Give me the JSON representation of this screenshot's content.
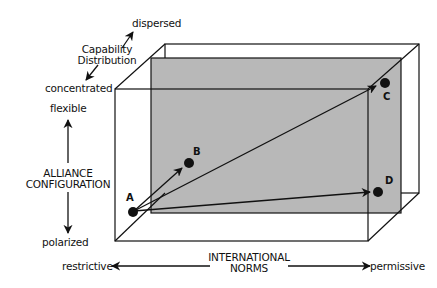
{
  "diagram": {
    "type": "3d-box-conceptual-diagram",
    "axes": {
      "capability_distribution": {
        "title_line1": "Capability",
        "title_line2": "Distribution",
        "high": "dispersed",
        "low": "concentrated"
      },
      "alliance_configuration": {
        "title_line1": "ALLIANCE",
        "title_line2": "CONFIGURATION",
        "high": "flexible",
        "low": "polarized"
      },
      "international_norms": {
        "title_line1": "INTERNATIONAL",
        "title_line2": "NORMS",
        "low": "restrictive",
        "high": "permissive"
      }
    },
    "points": [
      {
        "id": "A",
        "label": "A"
      },
      {
        "id": "B",
        "label": "B"
      },
      {
        "id": "C",
        "label": "C"
      },
      {
        "id": "D",
        "label": "D"
      }
    ],
    "arrows": [
      {
        "from": "A",
        "to": "B"
      },
      {
        "from": "A",
        "to": "C"
      },
      {
        "from": "A",
        "to": "D"
      }
    ],
    "colors": {
      "line": "#111111",
      "plane_fill": "#b8b8b8",
      "background": "#ffffff"
    }
  }
}
